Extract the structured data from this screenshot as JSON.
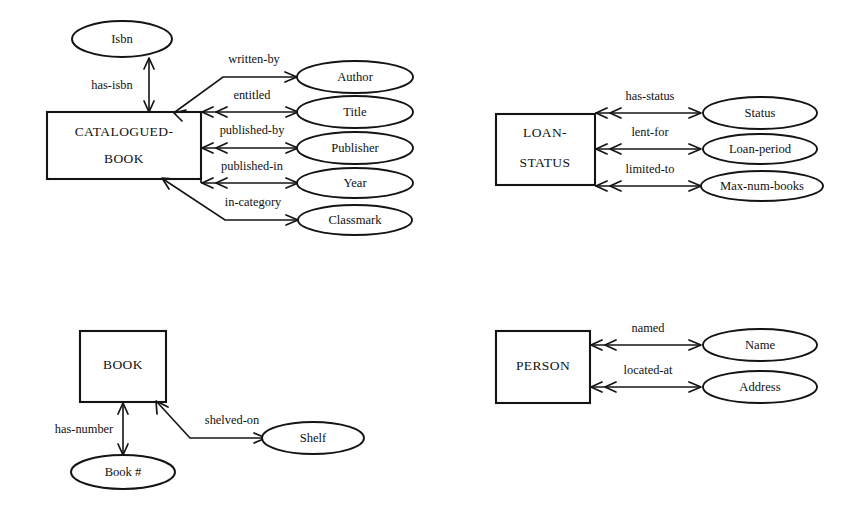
{
  "diagram": {
    "background_color": "#ffffff",
    "ink_color": "#141414",
    "groups": [
      {
        "id": "catalogued-book",
        "entity": {
          "label_line1": "CATALOGUED-",
          "label_line2": "BOOK"
        },
        "relationships": [
          {
            "label": "has-isbn",
            "attribute": "Isbn"
          },
          {
            "label": "written-by",
            "attribute": "Author"
          },
          {
            "label": "entitled",
            "attribute": "Title"
          },
          {
            "label": "published-by",
            "attribute": "Publisher"
          },
          {
            "label": "published-in",
            "attribute": "Year"
          },
          {
            "label": "in-category",
            "attribute": "Classmark"
          }
        ]
      },
      {
        "id": "loan-status",
        "entity": {
          "label_line1": "LOAN-",
          "label_line2": "STATUS"
        },
        "relationships": [
          {
            "label": "has-status",
            "attribute": "Status"
          },
          {
            "label": "lent-for",
            "attribute": "Loan-period"
          },
          {
            "label": "limited-to",
            "attribute": "Max-num-books"
          }
        ]
      },
      {
        "id": "book",
        "entity": {
          "label_line1": "BOOK",
          "label_line2": ""
        },
        "relationships": [
          {
            "label": "has-number",
            "attribute": "Book #"
          },
          {
            "label": "shelved-on",
            "attribute": "Shelf"
          }
        ]
      },
      {
        "id": "person",
        "entity": {
          "label_line1": "PERSON",
          "label_line2": ""
        },
        "relationships": [
          {
            "label": "named",
            "attribute": "Name"
          },
          {
            "label": "located-at",
            "attribute": "Address"
          }
        ]
      }
    ]
  }
}
